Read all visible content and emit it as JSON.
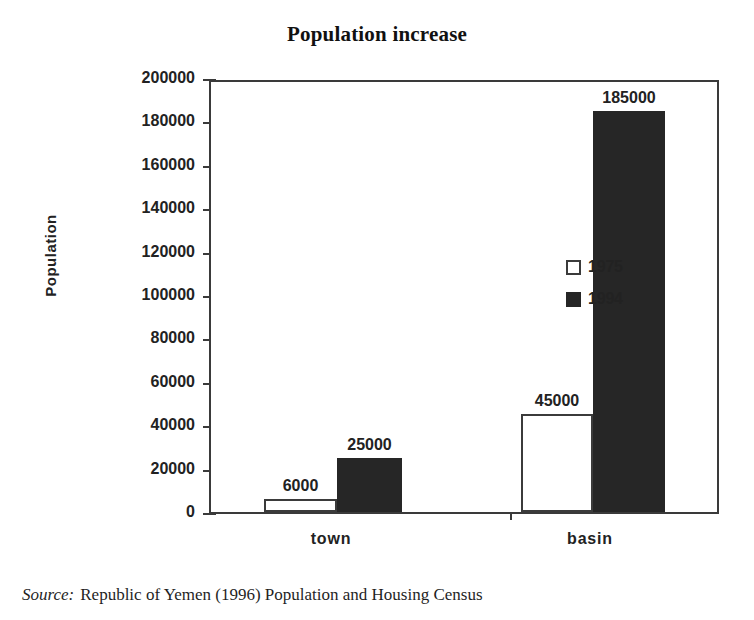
{
  "chart_data": {
    "type": "bar",
    "title": "Population increase",
    "xlabel": "",
    "ylabel": "Population",
    "categories": [
      "town",
      "basin"
    ],
    "series": [
      {
        "name": "1975",
        "values": [
          6000,
          25000
        ],
        "color": "#ffffff"
      },
      {
        "name": "1994",
        "values": [
          25000,
          185000
        ],
        "color": "#262626"
      }
    ],
    "bars": [
      {
        "category": "town",
        "series": "1975",
        "value": 6000,
        "label": "6000",
        "style": "light"
      },
      {
        "category": "town",
        "series": "1994",
        "value": 25000,
        "label": "25000",
        "style": "dark"
      },
      {
        "category": "basin",
        "series": "1975",
        "value": 45000,
        "label": "45000",
        "style": "light"
      },
      {
        "category": "basin",
        "series": "1994",
        "value": 185000,
        "label": "185000",
        "style": "dark"
      }
    ],
    "ylim": [
      0,
      200000
    ],
    "ytick_step": 20000,
    "yticks": [
      "200000",
      "180000",
      "160000",
      "140000",
      "120000",
      "100000",
      "80000",
      "60000",
      "40000",
      "20000",
      "0"
    ],
    "grid": false,
    "legend": {
      "position": "inside-center-upper",
      "entries": [
        {
          "label": "1975",
          "style": "light"
        },
        {
          "label": "1994",
          "style": "dark"
        }
      ]
    },
    "data_labels": [
      "6000",
      "25000",
      "45000",
      "185000"
    ],
    "colors": {
      "series_1975": "#ffffff",
      "series_1994": "#262626",
      "axis": "#3a3a3a",
      "text": "#222222"
    }
  },
  "caption": {
    "source_label": "Source:",
    "source_text": "Republic of Yemen (1996) Population and Housing Census"
  }
}
